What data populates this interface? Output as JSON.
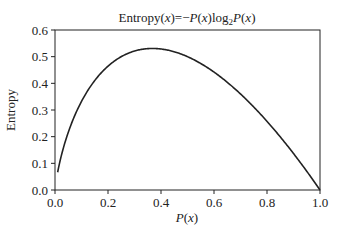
{
  "chart_data": {
    "type": "line",
    "xlabel": "P(x)",
    "ylabel": "Entropy",
    "xlim": [
      0.0,
      1.0
    ],
    "ylim": [
      0.0,
      0.6
    ],
    "xticks": [
      "0.0",
      "0.2",
      "0.4",
      "0.6",
      "0.8",
      "1.0"
    ],
    "yticks": [
      "0.0",
      "0.1",
      "0.2",
      "0.3",
      "0.4",
      "0.5",
      "0.6"
    ],
    "grid": false,
    "legend": null,
    "series": [
      {
        "name": "Entropy",
        "formula": "-p*log2(p)",
        "x": [
          0.01,
          0.02,
          0.05,
          0.1,
          0.15,
          0.2,
          0.25,
          0.3,
          0.35,
          0.368,
          0.4,
          0.45,
          0.5,
          0.55,
          0.6,
          0.65,
          0.7,
          0.75,
          0.8,
          0.85,
          0.9,
          0.95,
          1.0
        ],
        "values": [
          0.066,
          0.113,
          0.216,
          0.332,
          0.411,
          0.464,
          0.5,
          0.521,
          0.53,
          0.531,
          0.529,
          0.518,
          0.5,
          0.474,
          0.442,
          0.404,
          0.36,
          0.311,
          0.258,
          0.199,
          0.137,
          0.07,
          0.0
        ]
      }
    ],
    "line_color": "#222222"
  }
}
